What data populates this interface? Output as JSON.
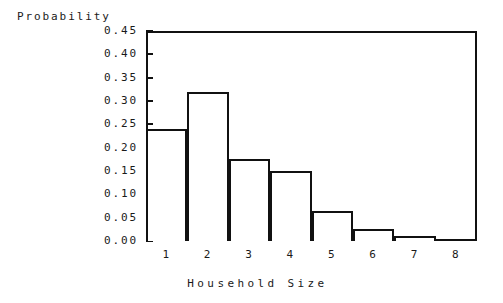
{
  "chart_data": {
    "type": "bar",
    "title": "",
    "xlabel": "Household Size",
    "ylabel": "Probability",
    "categories": [
      "1",
      "2",
      "3",
      "4",
      "5",
      "6",
      "7",
      "8"
    ],
    "values": [
      0.24,
      0.32,
      0.175,
      0.15,
      0.065,
      0.025,
      0.01,
      0.0
    ],
    "ylim": [
      0.0,
      0.45
    ],
    "xlim": [
      0.5,
      8.5
    ],
    "ytick_labels": [
      "0.45",
      "0.40",
      "0.35",
      "0.30",
      "0.25",
      "0.20",
      "0.15",
      "0.10",
      "0.05",
      "0.00"
    ],
    "ytick_values": [
      0.45,
      0.4,
      0.35,
      0.3,
      0.25,
      0.2,
      0.15,
      0.1,
      0.05,
      0.0
    ],
    "xtick_labels": [
      "1",
      "2",
      "3",
      "4",
      "5",
      "6",
      "7",
      "8"
    ],
    "grid": false,
    "legend": null,
    "legend_position": "none",
    "series": [
      {
        "name": "Probability",
        "values": [
          0.24,
          0.32,
          0.175,
          0.15,
          0.065,
          0.025,
          0.01,
          0.0
        ]
      }
    ],
    "bar_color": "#ffffff",
    "bar_edge_color": "#111111",
    "axis_color": "#111111",
    "background_color": "#ffffff"
  }
}
